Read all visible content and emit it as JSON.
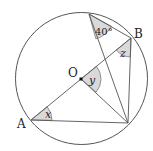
{
  "diagram": {
    "colors": {
      "stroke": "#555555",
      "shade": "#d9d9d9",
      "text": "#222222",
      "background": "#ffffff"
    },
    "circle": {
      "cx": 81.5,
      "cy": 78.5,
      "r": 66
    },
    "points": {
      "O": {
        "label": "O",
        "x": 81,
        "y": 79
      },
      "A": {
        "label": "A",
        "x": 31,
        "y": 120
      },
      "B": {
        "label": "B",
        "x": 131,
        "y": 38
      },
      "C": {
        "label": "",
        "x": 128,
        "y": 123
      },
      "D": {
        "label": "",
        "x": 89,
        "y": 14
      }
    },
    "segments": [
      "A-B",
      "A-C",
      "O-C",
      "D-B",
      "D-C",
      "B-C"
    ],
    "angles": {
      "at_D": {
        "label": "40°",
        "vertex": "D",
        "between": [
          "B",
          "C"
        ]
      },
      "at_B": {
        "label": "z",
        "vertex": "B",
        "between": [
          "A",
          "C"
        ]
      },
      "at_O": {
        "label": "y",
        "vertex": "O",
        "between": [
          "B",
          "C"
        ]
      },
      "at_A": {
        "label": "x",
        "vertex": "A",
        "between": [
          "B",
          "C"
        ]
      }
    }
  }
}
